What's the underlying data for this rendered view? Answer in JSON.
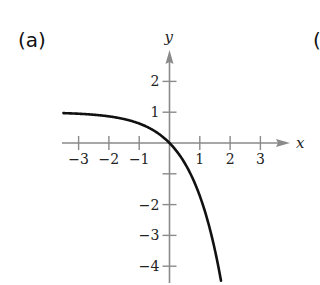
{
  "panel_label": "(a)",
  "next_panel_label": "(",
  "chart_data": {
    "type": "line",
    "title": "",
    "function": "y = 1 - e^x",
    "xlabel": "x",
    "ylabel": "y",
    "xlim": [
      -3.5,
      3.9
    ],
    "ylim": [
      -4.6,
      2.9
    ],
    "x_ticks": [
      -3,
      -2,
      -1,
      1,
      2,
      3
    ],
    "x_tick_labels": [
      "−3",
      "−2",
      "−1",
      "1",
      "2",
      "3"
    ],
    "y_ticks": [
      2,
      1,
      -1,
      -2,
      -3,
      -4
    ],
    "y_tick_labels": [
      "2",
      "1",
      "",
      "−2",
      "−3",
      "−4"
    ],
    "horizontal_asymptote": 1,
    "grid": false,
    "legend": null,
    "series": [
      {
        "name": "curve",
        "x": [
          -3.5,
          -3,
          -2.5,
          -2,
          -1.5,
          -1,
          -0.5,
          0,
          0.5,
          1,
          1.25,
          1.5,
          1.72
        ],
        "y": [
          0.97,
          0.95,
          0.92,
          0.86,
          0.78,
          0.63,
          0.39,
          0,
          -0.65,
          -1.72,
          -2.49,
          -3.48,
          -4.58
        ]
      }
    ],
    "colors": {
      "curve": "#111111",
      "axes": "#8a8a8a"
    }
  }
}
